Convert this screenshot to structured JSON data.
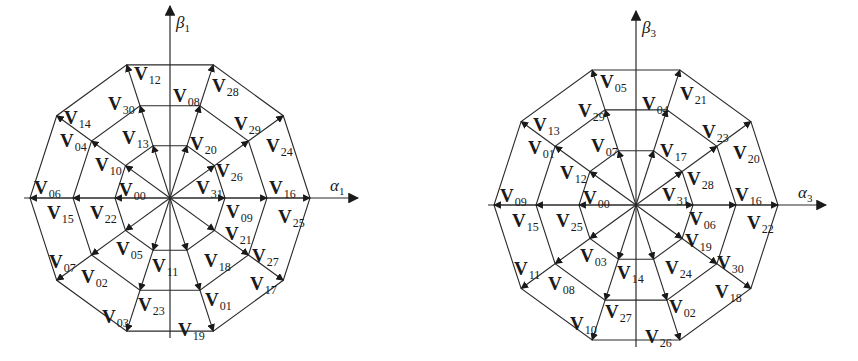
{
  "diagrams": [
    {
      "id": "alpha1-beta1",
      "center": [
        170,
        198
      ],
      "radii": [
        55,
        97,
        140
      ],
      "axes": {
        "x_label": "α",
        "x_sub": "1",
        "y_label": "β",
        "y_sub": "1"
      },
      "rings": {
        "inner": [
          "V31",
          "V20",
          "V13",
          "V10",
          "V00",
          "V05",
          "V11",
          "V18",
          "V21",
          "V26"
        ],
        "middle": [
          "V09",
          "V26",
          "V08",
          "V30",
          "V04",
          "V22",
          "V02",
          "V23",
          "V01",
          "V27"
        ],
        "outer": [
          "V16",
          "V29",
          "V28",
          "V12",
          "V14",
          "V06",
          "V07",
          "V03",
          "V19",
          "V17"
        ]
      },
      "labels": [
        {
          "t": "V",
          "s": "12",
          "x": 134,
          "y": 80
        },
        {
          "t": "V",
          "s": "28",
          "x": 212,
          "y": 92
        },
        {
          "t": "V",
          "s": "08",
          "x": 173,
          "y": 102
        },
        {
          "t": "V",
          "s": "30",
          "x": 108,
          "y": 110
        },
        {
          "t": "V",
          "s": "14",
          "x": 64,
          "y": 124
        },
        {
          "t": "V",
          "s": "29",
          "x": 234,
          "y": 130
        },
        {
          "t": "V",
          "s": "04",
          "x": 60,
          "y": 147
        },
        {
          "t": "V",
          "s": "24",
          "x": 266,
          "y": 152
        },
        {
          "t": "V",
          "s": "13",
          "x": 122,
          "y": 144
        },
        {
          "t": "V",
          "s": "20",
          "x": 190,
          "y": 150
        },
        {
          "t": "V",
          "s": "10",
          "x": 95,
          "y": 171
        },
        {
          "t": "V",
          "s": "26",
          "x": 216,
          "y": 177
        },
        {
          "t": "V",
          "s": "06",
          "x": 34,
          "y": 194
        },
        {
          "t": "V",
          "s": "00",
          "x": 119,
          "y": 196
        },
        {
          "t": "V",
          "s": "31",
          "x": 196,
          "y": 194
        },
        {
          "t": "V",
          "s": "16",
          "x": 269,
          "y": 194
        },
        {
          "t": "V",
          "s": "15",
          "x": 47,
          "y": 219
        },
        {
          "t": "V",
          "s": "22",
          "x": 90,
          "y": 219
        },
        {
          "t": "V",
          "s": "09",
          "x": 226,
          "y": 218
        },
        {
          "t": "V",
          "s": "25",
          "x": 278,
          "y": 223
        },
        {
          "t": "V",
          "s": "21",
          "x": 225,
          "y": 240
        },
        {
          "t": "V",
          "s": "05",
          "x": 116,
          "y": 255
        },
        {
          "t": "V",
          "s": "11",
          "x": 152,
          "y": 272
        },
        {
          "t": "V",
          "s": "18",
          "x": 204,
          "y": 267
        },
        {
          "t": "V",
          "s": "07",
          "x": 49,
          "y": 268
        },
        {
          "t": "V",
          "s": "27",
          "x": 252,
          "y": 262
        },
        {
          "t": "V",
          "s": "02",
          "x": 81,
          "y": 283
        },
        {
          "t": "V",
          "s": "17",
          "x": 250,
          "y": 290
        },
        {
          "t": "V",
          "s": "23",
          "x": 138,
          "y": 311
        },
        {
          "t": "V",
          "s": "01",
          "x": 205,
          "y": 306
        },
        {
          "t": "V",
          "s": "03",
          "x": 102,
          "y": 323
        },
        {
          "t": "V",
          "s": "19",
          "x": 178,
          "y": 336
        }
      ]
    },
    {
      "id": "alpha3-beta3",
      "center": [
        636,
        205
      ],
      "radii": [
        57,
        100,
        142
      ],
      "axes": {
        "x_label": "α",
        "x_sub": "3",
        "y_label": "β",
        "y_sub": "3"
      },
      "labels": [
        {
          "t": "V",
          "s": "05",
          "x": 600,
          "y": 88
        },
        {
          "t": "V",
          "s": "21",
          "x": 680,
          "y": 100
        },
        {
          "t": "V",
          "s": "04",
          "x": 642,
          "y": 110
        },
        {
          "t": "V",
          "s": "29",
          "x": 578,
          "y": 117
        },
        {
          "t": "V",
          "s": "13",
          "x": 533,
          "y": 131
        },
        {
          "t": "V",
          "s": "23",
          "x": 702,
          "y": 138
        },
        {
          "t": "V",
          "s": "01",
          "x": 528,
          "y": 154
        },
        {
          "t": "V",
          "s": "20",
          "x": 733,
          "y": 159
        },
        {
          "t": "V",
          "s": "07",
          "x": 591,
          "y": 152
        },
        {
          "t": "V",
          "s": "17",
          "x": 660,
          "y": 157
        },
        {
          "t": "V",
          "s": "12",
          "x": 560,
          "y": 179
        },
        {
          "t": "V",
          "s": "28",
          "x": 687,
          "y": 185
        },
        {
          "t": "V",
          "s": "09",
          "x": 500,
          "y": 202
        },
        {
          "t": "V",
          "s": "00",
          "x": 583,
          "y": 204
        },
        {
          "t": "V",
          "s": "31",
          "x": 662,
          "y": 201
        },
        {
          "t": "V",
          "s": "16",
          "x": 735,
          "y": 201
        },
        {
          "t": "V",
          "s": "15",
          "x": 512,
          "y": 227
        },
        {
          "t": "V",
          "s": "25",
          "x": 556,
          "y": 227
        },
        {
          "t": "V",
          "s": "06",
          "x": 689,
          "y": 225
        },
        {
          "t": "V",
          "s": "22",
          "x": 747,
          "y": 229
        },
        {
          "t": "V",
          "s": "19",
          "x": 685,
          "y": 247
        },
        {
          "t": "V",
          "s": "03",
          "x": 580,
          "y": 262
        },
        {
          "t": "V",
          "s": "14",
          "x": 617,
          "y": 279
        },
        {
          "t": "V",
          "s": "24",
          "x": 665,
          "y": 274
        },
        {
          "t": "V",
          "s": "11",
          "x": 514,
          "y": 275
        },
        {
          "t": "V",
          "s": "30",
          "x": 717,
          "y": 269
        },
        {
          "t": "V",
          "s": "08",
          "x": 548,
          "y": 290
        },
        {
          "t": "V",
          "s": "18",
          "x": 715,
          "y": 298
        },
        {
          "t": "V",
          "s": "27",
          "x": 605,
          "y": 318
        },
        {
          "t": "V",
          "s": "02",
          "x": 669,
          "y": 313
        },
        {
          "t": "V",
          "s": "10",
          "x": 570,
          "y": 330
        },
        {
          "t": "V",
          "s": "26",
          "x": 645,
          "y": 343
        }
      ]
    }
  ]
}
